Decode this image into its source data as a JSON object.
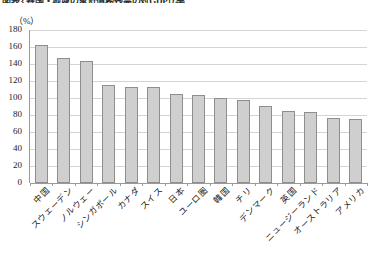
{
  "figure": {
    "title_sliver": "図表3 各国・地域の家計債務残高の対GDP比率",
    "unit_label": "（%）"
  },
  "chart_data": {
    "type": "bar",
    "title": "",
    "xlabel": "",
    "ylabel": "",
    "unit": "（%）",
    "ylim": [
      0,
      180
    ],
    "ytick_step": 20,
    "yticks": [
      "180",
      "160",
      "140",
      "120",
      "100",
      "80",
      "60",
      "40",
      "20",
      "0"
    ],
    "grid": true,
    "legend": "none",
    "orientation": "vertical",
    "bar_color": "#cfcfcf",
    "bar_border_color": "#8e8e8e",
    "categories": [
      "中国",
      "スウェーデン",
      "ノルウェー",
      "シンガポール",
      "カナダ",
      "スイス",
      "日本",
      "ユーロ圏",
      "韓国",
      "チリ",
      "デンマーク",
      "英国",
      "ニュージーランド",
      "オーストラリア",
      "アメリカ"
    ],
    "values": [
      162,
      147,
      144,
      115,
      113,
      113,
      105,
      103,
      100,
      98,
      91,
      85,
      83,
      77,
      75
    ]
  }
}
